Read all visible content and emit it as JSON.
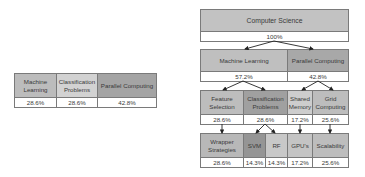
{
  "background_ghost_text": "",
  "summary_table": {
    "columns": [
      {
        "label": "Machine Learning",
        "value": "28.6%",
        "color": "#bcbcbc"
      },
      {
        "label": "Classification Problems",
        "value": "28.6%",
        "color": "#d2d2d2"
      },
      {
        "label": "Parallel Computing",
        "value": "42.8%",
        "color": "#a4a4a4"
      }
    ]
  },
  "tree": {
    "root": {
      "label": "Computer Science",
      "value": "100%",
      "color": "#c2c2c2"
    },
    "level1": [
      {
        "label": "Machine Learning",
        "value": "57.2%",
        "color": "#bfbfbf"
      },
      {
        "label": "Parallel Computing",
        "value": "42.8%",
        "color": "#a8a8a8"
      }
    ],
    "level2": [
      {
        "label": "Feature Selection",
        "value": "28.6%",
        "color": "#bdbdbd"
      },
      {
        "label": "Classification Problems",
        "value": "28.6%",
        "color": "#a0a0a0"
      },
      {
        "label": "Shared Memory",
        "value": "17.2%",
        "color": "#cdcdcd"
      },
      {
        "label": "Grid Computing",
        "value": "25.6%",
        "color": "#bdbdbd"
      }
    ],
    "level3": [
      {
        "label": "Wrapper Strategies",
        "value": "28.6%",
        "color": "#b8b8b8"
      },
      {
        "label": "SVM",
        "value": "14.3%",
        "color": "#959595"
      },
      {
        "label": "RF",
        "value": "14.3%",
        "color": "#c8c8c8"
      },
      {
        "label": "GPU's",
        "value": "17.2%",
        "color": "#c4c4c4"
      },
      {
        "label": "Scalability",
        "value": "25.6%",
        "color": "#bdbdbd"
      }
    ]
  }
}
